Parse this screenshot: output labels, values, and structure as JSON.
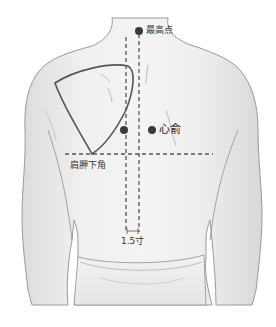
{
  "diagram": {
    "colors": {
      "skin": "#ececec",
      "outline": "#8a8a8a",
      "scapula": "#555555",
      "dashed_line": "#555555",
      "point": "#3a3a3a",
      "text": "#333333",
      "background": "#ffffff"
    },
    "labels": {
      "top_point": "最高点",
      "xinshu": "心俞",
      "scapula_angle": "肩胛下角",
      "distance": "1.5寸"
    },
    "points": [
      {
        "name": "top-point",
        "x": 139,
        "y": 31,
        "label": "最高点"
      },
      {
        "name": "spine-side-point",
        "x": 124,
        "y": 130
      },
      {
        "name": "xinshu-point",
        "x": 152,
        "y": 130,
        "label": "心俞"
      }
    ],
    "lines": {
      "spine_midline_x": 139,
      "offset_line_x": 126,
      "scapula_horizontal_y": 154
    }
  }
}
